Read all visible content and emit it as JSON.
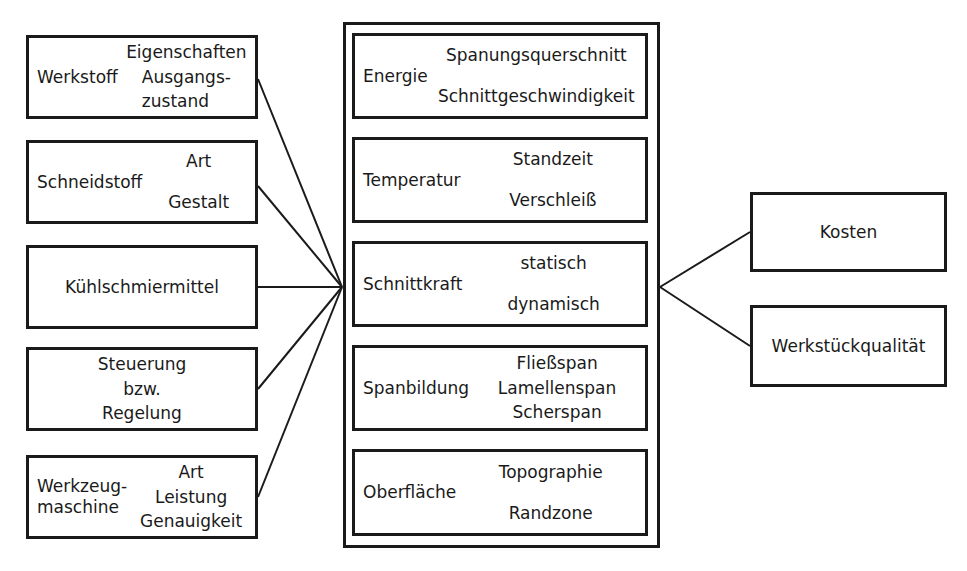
{
  "diagram": {
    "colors": {
      "stroke": "#1a1a1a",
      "background": "#ffffff",
      "text": "#1a1a1a"
    },
    "input_boxes": [
      {
        "id": "werkstoff",
        "main": "Werkstoff",
        "subs": [
          "Eigenschaften",
          "Ausgangs-\nzustand"
        ]
      },
      {
        "id": "schneidstoff",
        "main": "Schneidstoff",
        "subs": [
          "Art",
          "Gestalt"
        ]
      },
      {
        "id": "kuehlschmiermittel",
        "main": "Kühlschmiermittel",
        "subs": []
      },
      {
        "id": "steuerung",
        "main": "",
        "subs": [
          "Steuerung",
          "bzw.",
          "Regelung"
        ]
      },
      {
        "id": "werkzeugmaschine",
        "main": "Werkzeug-\nmaschine",
        "subs": [
          "Art",
          "Leistung",
          "Genauigkeit"
        ]
      }
    ],
    "process_boxes": [
      {
        "id": "energie",
        "main": "Energie",
        "subs": [
          "Spanungsquerschnitt",
          "Schnittgeschwindigkeit"
        ]
      },
      {
        "id": "temperatur",
        "main": "Temperatur",
        "subs": [
          "Standzeit",
          "Verschleiß"
        ]
      },
      {
        "id": "schnittkraft",
        "main": "Schnittkraft",
        "subs": [
          "statisch",
          "dynamisch"
        ]
      },
      {
        "id": "spanbildung",
        "main": "Spanbildung",
        "subs": [
          "Fließspan",
          "Lamellenspan",
          "Scherspan"
        ]
      },
      {
        "id": "oberflaeche",
        "main": "Oberfläche",
        "subs": [
          "Topographie",
          "Randzone"
        ]
      }
    ],
    "output_boxes": [
      {
        "id": "kosten",
        "main": "Kosten",
        "subs": []
      },
      {
        "id": "werkstueckqualitaet",
        "main": "Werkstückqualität",
        "subs": []
      }
    ]
  }
}
